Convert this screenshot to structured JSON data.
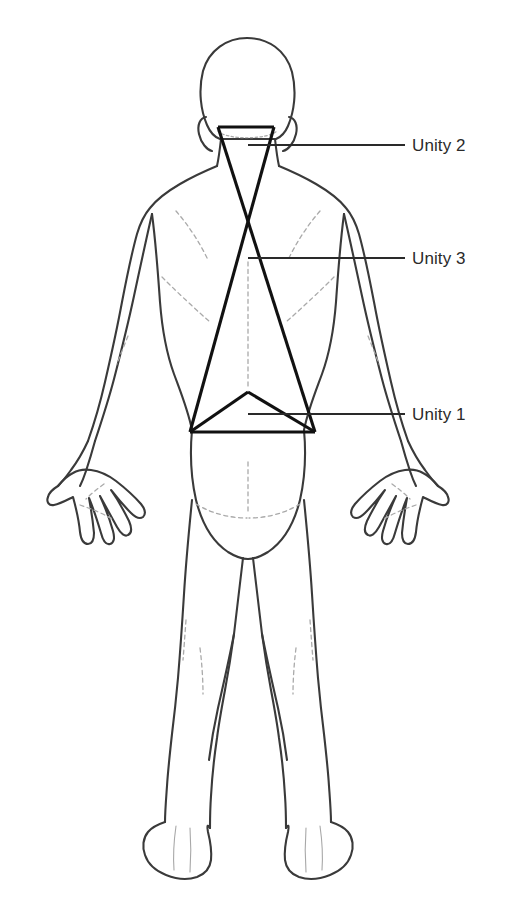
{
  "diagram": {
    "view": "posterior",
    "background_color": "#ffffff",
    "outline_color": "#3a3a3a",
    "detail_color": "#9a9a9a",
    "overlay_color": "#111111",
    "labels": [
      {
        "id": "unity-2",
        "text": "Unity 2",
        "leader_start": [
          248,
          145
        ],
        "leader_end": [
          405,
          145
        ],
        "text_x": 412,
        "text_y": 145
      },
      {
        "id": "unity-3",
        "text": "Unity 3",
        "leader_start": [
          248,
          258
        ],
        "leader_end": [
          405,
          258
        ],
        "text_x": 412,
        "text_y": 258
      },
      {
        "id": "unity-1",
        "text": "Unity 1",
        "leader_start": [
          248,
          414
        ],
        "leader_end": [
          405,
          414
        ],
        "text_x": 412,
        "text_y": 414
      }
    ],
    "overlay_shapes": [
      {
        "id": "large-triangle",
        "kind": "triangle",
        "points": [
          [
            218,
            127
          ],
          [
            190,
            432
          ],
          [
            315,
            432
          ]
        ]
      },
      {
        "id": "crossing-triangle",
        "kind": "triangle",
        "points": [
          [
            274,
            127
          ],
          [
            190,
            432
          ],
          [
            315,
            432
          ]
        ]
      },
      {
        "id": "small-triangle",
        "kind": "triangle",
        "points": [
          [
            248,
            392
          ],
          [
            190,
            432
          ],
          [
            315,
            432
          ]
        ]
      }
    ],
    "crossing_point": [
      248,
      222
    ],
    "caption_partial": "illegible cropped caption line"
  }
}
